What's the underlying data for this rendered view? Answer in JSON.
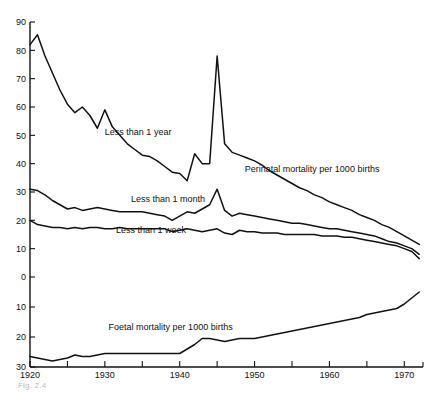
{
  "figure": {
    "caption": "Fig. 2.4"
  },
  "chart_data": {
    "type": "line",
    "title": "",
    "subtitle": "",
    "xlabel": "",
    "ylabel": "",
    "grid": false,
    "legend_position": "inline-labels",
    "xlim": [
      1920,
      1972.5
    ],
    "x_ticks": [
      1920,
      1925,
      1930,
      1935,
      1940,
      1945,
      1950,
      1955,
      1960,
      1965,
      1970
    ],
    "x_tick_labels": [
      "1920",
      "",
      "1930",
      "",
      "1940",
      "",
      "1950",
      "",
      "1960",
      "",
      "1970"
    ],
    "upper_axis": {
      "name": "Perinatal mortality per 1000 births",
      "ylim": [
        0,
        90
      ],
      "y_ticks": [
        0,
        10,
        20,
        30,
        40,
        50,
        60,
        70,
        80,
        90
      ],
      "y_tick_labels": [
        "0",
        "10",
        "20",
        "30",
        "40",
        "50",
        "60",
        "70",
        "80",
        "90"
      ]
    },
    "lower_axis": {
      "name": "Foetal mortality per 1000 births",
      "ylim": [
        0,
        30
      ],
      "inverted": true,
      "y_ticks": [
        10,
        20,
        30
      ],
      "y_tick_labels": [
        "10",
        "20",
        "30"
      ]
    },
    "annotations": [
      {
        "text": "Less than 1 year",
        "x": 1930.0,
        "y": 50.0
      },
      {
        "text": "Less than 1 month",
        "x": 1933.5,
        "y": 26.5
      },
      {
        "text": "Less than 1 week",
        "x": 1931.5,
        "y": 15.5
      },
      {
        "text": "Perinatal mortality per 1000 births",
        "x": 1948.7,
        "y": 37.0
      },
      {
        "text": "Foetal mortality per 1000 births",
        "x": 1930.5,
        "y": 17.5
      }
    ],
    "series": [
      {
        "name": "Less than 1 year",
        "axis": "upper",
        "x": [
          1920,
          1921,
          1922,
          1923,
          1924,
          1925,
          1926,
          1927,
          1928,
          1929,
          1930,
          1931,
          1932,
          1933,
          1934,
          1935,
          1936,
          1937,
          1938,
          1939,
          1940,
          1941,
          1942,
          1943,
          1944,
          1945,
          1946,
          1947,
          1948,
          1949,
          1950,
          1951,
          1952,
          1953,
          1954,
          1955,
          1956,
          1957,
          1958,
          1959,
          1960,
          1961,
          1962,
          1963,
          1964,
          1965,
          1966,
          1967,
          1968,
          1969,
          1970,
          1971,
          1972
        ],
        "values": [
          82,
          85.5,
          78,
          72,
          66,
          61,
          58,
          60,
          57,
          52.5,
          59,
          53,
          50,
          47,
          45,
          43,
          42.5,
          41,
          39,
          37,
          36.5,
          34,
          43.5,
          40,
          40,
          78,
          47,
          44,
          43,
          42,
          41,
          39.5,
          37.5,
          36,
          34.5,
          33,
          31.5,
          30.5,
          29,
          28,
          26.5,
          25.5,
          24.5,
          23.5,
          22,
          21,
          20,
          18.5,
          17.5,
          16,
          14.5,
          13,
          11.5
        ]
      },
      {
        "name": "Less than 1 month",
        "axis": "upper",
        "x": [
          1920,
          1921,
          1922,
          1923,
          1924,
          1925,
          1926,
          1927,
          1928,
          1929,
          1930,
          1931,
          1932,
          1933,
          1934,
          1935,
          1936,
          1937,
          1938,
          1939,
          1940,
          1941,
          1942,
          1943,
          1944,
          1945,
          1946,
          1947,
          1948,
          1949,
          1950,
          1951,
          1952,
          1953,
          1954,
          1955,
          1956,
          1957,
          1958,
          1959,
          1960,
          1961,
          1962,
          1963,
          1964,
          1965,
          1966,
          1967,
          1968,
          1969,
          1970,
          1971,
          1972
        ],
        "values": [
          31,
          30.5,
          29,
          27,
          25.5,
          24,
          24.5,
          23.5,
          24,
          24.5,
          24,
          23.5,
          23,
          23,
          23,
          23,
          22.5,
          22,
          21.5,
          20,
          21.5,
          23,
          22.5,
          24,
          25.5,
          31,
          23.5,
          21.5,
          22.5,
          22,
          21.5,
          21,
          20.5,
          20,
          19.5,
          19,
          19,
          18.5,
          18,
          17.5,
          17,
          17,
          16.5,
          16,
          15.5,
          15,
          14.5,
          13.5,
          12.5,
          12,
          11,
          10,
          8
        ]
      },
      {
        "name": "Less than 1 week",
        "axis": "upper",
        "x": [
          1920,
          1921,
          1922,
          1923,
          1924,
          1925,
          1926,
          1927,
          1928,
          1929,
          1930,
          1931,
          1932,
          1933,
          1934,
          1935,
          1936,
          1937,
          1938,
          1939,
          1940,
          1941,
          1942,
          1943,
          1944,
          1945,
          1946,
          1947,
          1948,
          1949,
          1950,
          1951,
          1952,
          1953,
          1954,
          1955,
          1956,
          1957,
          1958,
          1959,
          1960,
          1961,
          1962,
          1963,
          1964,
          1965,
          1966,
          1967,
          1968,
          1969,
          1970,
          1971,
          1972
        ],
        "values": [
          20,
          18.5,
          18,
          17.5,
          17.5,
          17,
          17.5,
          17,
          17.5,
          17.5,
          17,
          17,
          17.5,
          17,
          17,
          17,
          17,
          17,
          17,
          16,
          16.5,
          17,
          16.5,
          16,
          16.5,
          17,
          15.5,
          15,
          16.5,
          16,
          16,
          15.5,
          15.5,
          15.5,
          15,
          15,
          15,
          15,
          15,
          14.5,
          14.5,
          14.5,
          14,
          14,
          13.5,
          13,
          12.5,
          12,
          11.5,
          11,
          10,
          9,
          6.5
        ]
      },
      {
        "name": "Foetal mortality per 1000 births",
        "axis": "lower",
        "x": [
          1920,
          1921,
          1922,
          1923,
          1924,
          1925,
          1926,
          1927,
          1928,
          1929,
          1930,
          1931,
          1932,
          1933,
          1934,
          1935,
          1936,
          1937,
          1938,
          1939,
          1940,
          1941,
          1942,
          1943,
          1944,
          1945,
          1946,
          1947,
          1948,
          1949,
          1950,
          1951,
          1952,
          1953,
          1954,
          1955,
          1956,
          1957,
          1958,
          1959,
          1960,
          1961,
          1962,
          1963,
          1964,
          1965,
          1966,
          1967,
          1968,
          1969,
          1970,
          1971,
          1972
        ],
        "values": [
          26.5,
          27,
          27.5,
          28,
          27.5,
          27,
          26,
          26.5,
          26.5,
          26,
          25.5,
          25.5,
          25.5,
          25.5,
          25.5,
          25.5,
          25.5,
          25.5,
          25.5,
          25.5,
          25.5,
          24,
          22.5,
          20.5,
          20.5,
          21,
          21.5,
          21,
          20.5,
          20.5,
          20.5,
          20,
          19.5,
          19,
          18.5,
          18,
          17.5,
          17,
          16.5,
          16,
          15.5,
          15,
          14.5,
          14,
          13.5,
          12.5,
          12,
          11.5,
          11,
          10.5,
          9,
          7,
          5
        ]
      }
    ]
  }
}
